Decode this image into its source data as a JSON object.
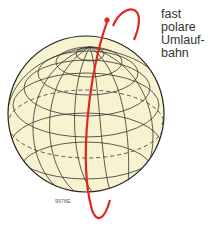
{
  "label": {
    "lines": [
      "fast",
      "polare",
      "Umlauf-",
      "bahn"
    ]
  },
  "code": "9978E",
  "colors": {
    "globe_fill": "#f7f2cf",
    "grid": "#333333",
    "orbit": "#e0261c",
    "text": "#333333"
  }
}
